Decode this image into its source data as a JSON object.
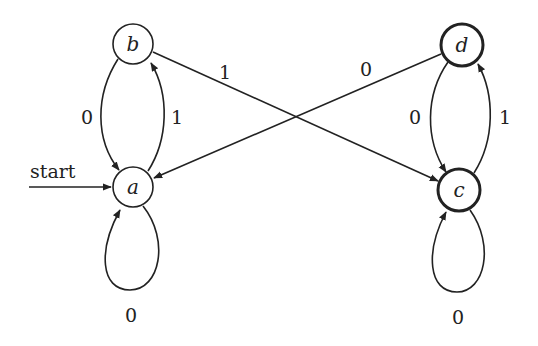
{
  "diagram": {
    "type": "finite-automaton",
    "start_label": "start",
    "start_state": "a",
    "states": [
      {
        "id": "a",
        "label": "a",
        "accepting": false,
        "x": 133,
        "y": 187
      },
      {
        "id": "b",
        "label": "b",
        "accepting": false,
        "x": 133,
        "y": 44
      },
      {
        "id": "c",
        "label": "c",
        "accepting": true,
        "x": 459,
        "y": 190
      },
      {
        "id": "d",
        "label": "d",
        "accepting": true,
        "x": 462,
        "y": 45
      }
    ],
    "transitions": [
      {
        "from": "b",
        "to": "a",
        "symbol": "0"
      },
      {
        "from": "a",
        "to": "b",
        "symbol": "1"
      },
      {
        "from": "a",
        "to": "a",
        "symbol": "0"
      },
      {
        "from": "b",
        "to": "c",
        "symbol": "1"
      },
      {
        "from": "d",
        "to": "a",
        "symbol": "0"
      },
      {
        "from": "d",
        "to": "c",
        "symbol": "0"
      },
      {
        "from": "c",
        "to": "d",
        "symbol": "1"
      },
      {
        "from": "c",
        "to": "c",
        "symbol": "0"
      }
    ],
    "edge_labels": {
      "b_a": "0",
      "a_b": "1",
      "a_a": "0",
      "b_c": "1",
      "d_a": "0",
      "d_c": "0",
      "c_d": "1",
      "c_c": "0"
    },
    "colors": {
      "stroke": "#222222",
      "background": "#ffffff"
    }
  }
}
